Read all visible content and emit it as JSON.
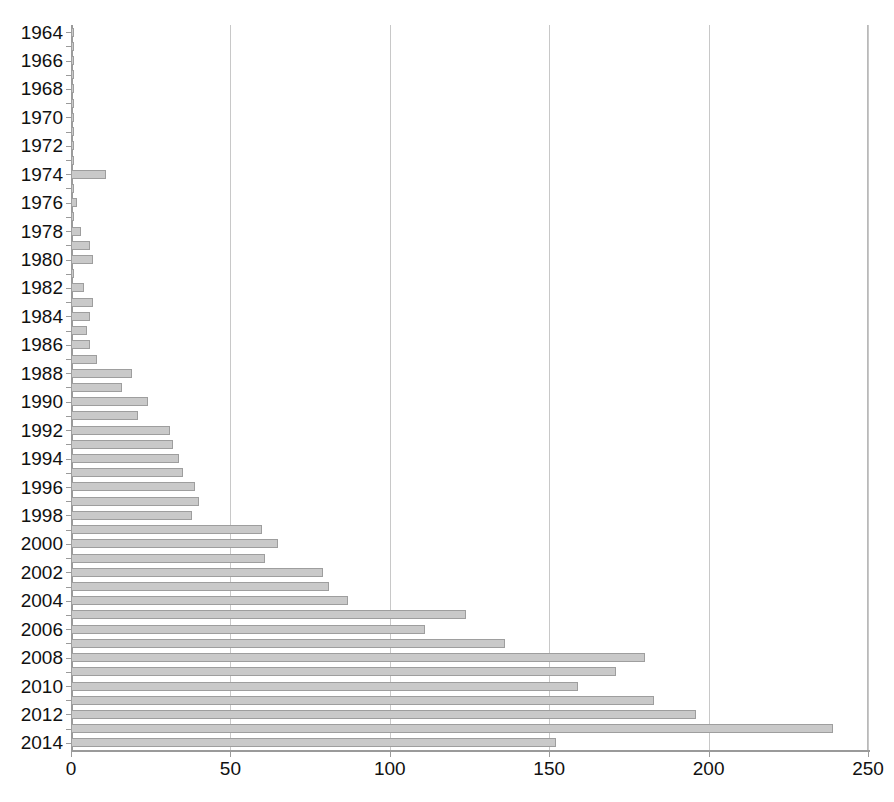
{
  "chart_data": {
    "type": "bar",
    "orientation": "horizontal",
    "title": "",
    "subtitle": "",
    "xlabel": "",
    "ylabel": "",
    "xlim": [
      0,
      250
    ],
    "ylim": null,
    "grid": true,
    "legend": null,
    "legend_position": "none",
    "x_ticks": [
      0,
      50,
      100,
      150,
      200,
      250
    ],
    "x_tick_labels": [
      "0",
      "50",
      "100",
      "150",
      "200",
      "250"
    ],
    "y_tick_labels": [
      "1964",
      "1966",
      "1968",
      "1970",
      "1972",
      "1974",
      "1976",
      "1978",
      "1980",
      "1982",
      "1984",
      "1986",
      "1988",
      "1990",
      "1992",
      "1994",
      "1996",
      "1998",
      "2000",
      "2002",
      "2004",
      "2006",
      "2008",
      "2010",
      "2012",
      "2014"
    ],
    "categories": [
      "1964",
      "1965",
      "1966",
      "1967",
      "1968",
      "1969",
      "1970",
      "1971",
      "1972",
      "1973",
      "1974",
      "1975",
      "1976",
      "1977",
      "1978",
      "1979",
      "1980",
      "1981",
      "1982",
      "1983",
      "1984",
      "1985",
      "1986",
      "1987",
      "1988",
      "1989",
      "1990",
      "1991",
      "1992",
      "1993",
      "1994",
      "1995",
      "1996",
      "1997",
      "1998",
      "1999",
      "2000",
      "2001",
      "2002",
      "2003",
      "2004",
      "2005",
      "2006",
      "2007",
      "2008",
      "2009",
      "2010",
      "2011",
      "2012",
      "2013",
      "2014"
    ],
    "values": [
      1,
      1,
      1,
      1,
      1,
      1,
      1,
      1,
      1,
      1,
      11,
      1,
      2,
      1,
      3,
      6,
      7,
      1,
      4,
      7,
      6,
      5,
      6,
      8,
      19,
      16,
      24,
      21,
      31,
      32,
      34,
      35,
      39,
      40,
      38,
      60,
      65,
      61,
      79,
      81,
      87,
      124,
      111,
      136,
      180,
      171,
      159,
      183,
      196,
      239,
      152
    ],
    "bar_color": "#c9c9c9",
    "bar_edge_color": "#9e9e9e",
    "grid_color": "#c8c8c8",
    "axis_color": "#9a9a9a",
    "background_color": "#ffffff"
  }
}
